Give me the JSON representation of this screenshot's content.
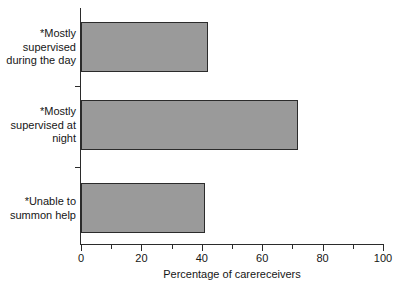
{
  "chart_data": {
    "type": "bar",
    "orientation": "horizontal",
    "title": "",
    "subtitle": "",
    "xlabel": "Percentage of carereceivers",
    "ylabel": "",
    "categories": [
      "*Mostly supervised during the day",
      "*Mostly supervised at night",
      "*Unable to summon help"
    ],
    "values": [
      42,
      72,
      41
    ],
    "xlim": [
      0,
      100
    ],
    "xticks": [
      0,
      20,
      40,
      60,
      80,
      100
    ],
    "xtick_labels": [
      "0",
      "20",
      "40",
      "60",
      "80",
      "100"
    ],
    "minor_xticks": [
      10,
      30,
      50,
      70,
      90
    ],
    "grid": false,
    "legend": false,
    "bar_fill_color": "#9a9a9a",
    "bar_edge_color": "#2b2b2b",
    "background_color": "#ffffff"
  },
  "bars": [
    {
      "label_lines": "*Mostly\nsupervised\nduring the day",
      "value": 42
    },
    {
      "label_lines": "*Mostly\nsupervised at\nnight",
      "value": 72
    },
    {
      "label_lines": "*Unable to\nsummon help",
      "value": 41
    }
  ],
  "axis": {
    "x_title": "Percentage of carereceivers",
    "tick_labels": {
      "t0": "0",
      "t20": "20",
      "t40": "40",
      "t60": "60",
      "t80": "80",
      "t100": "100"
    }
  }
}
